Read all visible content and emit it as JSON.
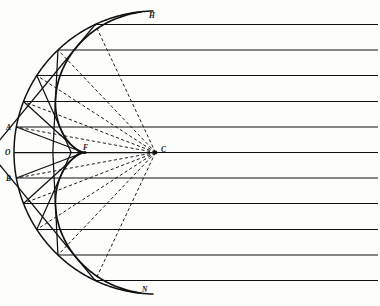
{
  "figure": {
    "background_color": "#fdfdfc",
    "ink_color": "#111111",
    "width": 380,
    "height": 306
  },
  "labels": [
    {
      "id": "H",
      "text": "H",
      "x": 149,
      "y": 18,
      "anchor": "start"
    },
    {
      "id": "A",
      "text": "A",
      "x": 6,
      "y": 130,
      "anchor": "start"
    },
    {
      "id": "O",
      "text": "O",
      "x": 5,
      "y": 155,
      "anchor": "start"
    },
    {
      "id": "F",
      "text": "F",
      "x": 83,
      "y": 150,
      "anchor": "start"
    },
    {
      "id": "C",
      "text": "C",
      "x": 161,
      "y": 152,
      "anchor": "start"
    },
    {
      "id": "B",
      "text": "B",
      "x": 6,
      "y": 181,
      "anchor": "start"
    },
    {
      "id": "N",
      "text": "N",
      "x": 142,
      "y": 292,
      "anchor": "start"
    }
  ],
  "geometry": {
    "center_x": 155.5,
    "center_y": 152.5,
    "mirror_radius": 141.5,
    "mirror_half_angle_deg": 89.0,
    "focus_x": 84.8,
    "focus_y": 152.5,
    "rays_right_edge": 378,
    "caustic_end_angle_deg": 86.0
  },
  "chart_data": {
    "type": "diagram",
    "elements": {
      "mirror_arc": "concave spherical mirror arc opening to the right, vertex at O",
      "incident_rays": "11 horizontal parallel rays entering from the right",
      "reflected_rays": "solid straight segments from each mirror strike point, tangent to the caustic",
      "radii": "dashed straight segments from centre of curvature C to each mirror strike point",
      "caustic": "nephroid-shaped bright curve with cusp at F, branches ending at H (top) and N (bottom)"
    },
    "ray_y_offsets": [
      -128,
      -102.5,
      -77,
      -51,
      -25.5,
      0,
      25.5,
      51,
      77,
      102.5,
      128
    ],
    "points": {
      "O": {
        "x": 14,
        "y": 152.5,
        "role": "mirror vertex"
      },
      "A": {
        "x": 17,
        "y": 127,
        "role": "mirror point above axis"
      },
      "B": {
        "x": 17,
        "y": 178,
        "role": "mirror point below axis"
      },
      "F": {
        "x": 85,
        "y": 152.5,
        "role": "principal focus / cusp of caustic"
      },
      "C": {
        "x": 155.5,
        "y": 152.5,
        "role": "centre of curvature"
      },
      "H": {
        "x": 146,
        "y": 22,
        "role": "upper end of caustic"
      },
      "N": {
        "x": 140,
        "y": 286,
        "role": "lower end of caustic"
      }
    },
    "counts": {
      "horizontal_rays": 11,
      "dashed_radii": 11,
      "solid_reflected_rays": 11
    }
  }
}
